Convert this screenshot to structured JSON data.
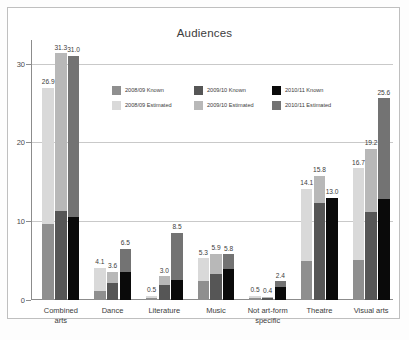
{
  "chart_data": {
    "type": "bar",
    "subtype": "grouped-stacked",
    "title": "Audiences",
    "xlabel": "",
    "ylabel": "",
    "ylim": [
      0,
      33
    ],
    "yticks": [
      0,
      10,
      20,
      30
    ],
    "ytick_labels": [
      "0",
      "10",
      "20",
      "30"
    ],
    "grid": true,
    "grid_axis": "y",
    "legend_position": "upper-center-inside",
    "categories": [
      "Combined\narts",
      "Dance",
      "Literature",
      "Music",
      "Not art-form\nspecific",
      "Theatre",
      "Visual arts"
    ],
    "series": [
      {
        "name": "2008/09 Known",
        "color": "#8f8f8f",
        "values": [
          9.6,
          1.2,
          0.2,
          2.4,
          0.2,
          5.0,
          5.1
        ]
      },
      {
        "name": "2008/09 Estimated",
        "color": "#d9d9d9",
        "values": [
          17.3,
          2.9,
          0.3,
          2.9,
          0.3,
          9.1,
          11.6
        ]
      },
      {
        "name": "2009/10 Known",
        "color": "#565656",
        "values": [
          11.3,
          2.2,
          1.9,
          3.3,
          0.3,
          12.3,
          11.2
        ]
      },
      {
        "name": "2009/10 Estimated",
        "color": "#b8b8b8",
        "values": [
          20.0,
          1.4,
          1.1,
          2.6,
          0.1,
          3.5,
          8.0
        ]
      },
      {
        "name": "2010/11 Known",
        "color": "#0a0a0a",
        "values": [
          10.5,
          3.6,
          2.6,
          3.9,
          1.6,
          13.0,
          12.8
        ]
      },
      {
        "name": "2010/11 Estimated",
        "color": "#737373",
        "values": [
          20.5,
          2.9,
          5.9,
          1.9,
          0.8,
          0.0,
          12.8
        ]
      }
    ],
    "bar_totals": [
      {
        "category": "Combined arts",
        "values": [
          26.9,
          31.3,
          31.0
        ],
        "labels": [
          "26.9",
          "31.3",
          "31.0"
        ]
      },
      {
        "category": "Dance",
        "values": [
          4.1,
          3.6,
          6.5
        ],
        "labels": [
          "4.1",
          "3.6",
          "6.5"
        ]
      },
      {
        "category": "Literature",
        "values": [
          0.5,
          3.0,
          8.5
        ],
        "labels": [
          "0.5",
          "3.0",
          "8.5"
        ]
      },
      {
        "category": "Music",
        "values": [
          5.3,
          5.9,
          5.8
        ],
        "labels": [
          "5.3",
          "5.9",
          "5.8"
        ]
      },
      {
        "category": "Not art-form specific",
        "values": [
          0.5,
          0.4,
          2.4
        ],
        "labels": [
          "0.5",
          "0.4",
          "2.4"
        ]
      },
      {
        "category": "Theatre",
        "values": [
          14.1,
          15.8,
          13.0
        ],
        "labels": [
          "14.1",
          "15.8",
          "13.0"
        ]
      },
      {
        "category": "Visual arts",
        "values": [
          16.7,
          19.2,
          25.6
        ],
        "labels": [
          "16.7",
          "19.2",
          "25.6"
        ]
      }
    ],
    "legend": [
      {
        "label": "2008/09 Known",
        "color": "#8f8f8f"
      },
      {
        "label": "2009/10 Known",
        "color": "#565656"
      },
      {
        "label": "2010/11 Known",
        "color": "#0a0a0a"
      },
      {
        "label": "2008/09 Estimated",
        "color": "#d9d9d9"
      },
      {
        "label": "2009/10 Estimated",
        "color": "#b8b8b8"
      },
      {
        "label": "2010/11 Estimated",
        "color": "#737373"
      }
    ]
  }
}
